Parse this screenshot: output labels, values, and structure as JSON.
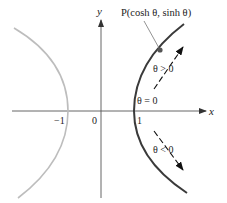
{
  "figure": {
    "axes": {
      "x_label": "x",
      "y_label": "y",
      "ticks": {
        "neg_one": "−1",
        "zero": "0",
        "one": "1"
      }
    },
    "point": {
      "label": "P(cosh θ, sinh θ)"
    },
    "annotations": {
      "theta_zero": "θ = 0",
      "theta_pos": "θ > 0",
      "theta_neg": "θ < 0"
    },
    "colors": {
      "right_branch": "#3a3a3a",
      "left_branch": "#bdbdbd",
      "axes": "#555555",
      "text": "#222222"
    }
  }
}
